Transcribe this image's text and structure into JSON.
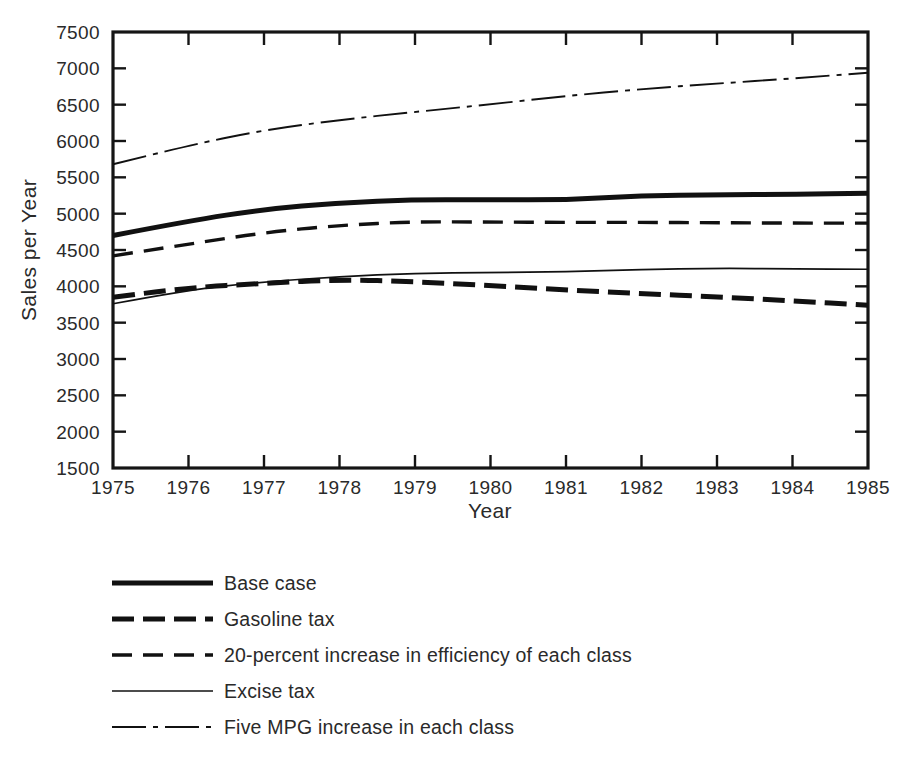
{
  "chart_data": {
    "type": "line",
    "title": "",
    "xlabel": "Year",
    "ylabel": "Sales per Year",
    "x": [
      1975,
      1976,
      1977,
      1978,
      1979,
      1980,
      1981,
      1982,
      1983,
      1984,
      1985
    ],
    "xtick_labels": [
      "1975",
      "1976",
      "1977",
      "1978",
      "1979",
      "1980",
      "1981",
      "1982",
      "1983",
      "1984",
      "1985"
    ],
    "xlim": [
      1975,
      1985
    ],
    "ylim": [
      1500,
      7500
    ],
    "ytick_labels": [
      "1500",
      "2000",
      "2500",
      "3000",
      "3500",
      "4000",
      "4500",
      "5000",
      "5500",
      "6000",
      "6500",
      "7000",
      "7500"
    ],
    "ytick_values": [
      1500,
      2000,
      2500,
      3000,
      3500,
      4000,
      4500,
      5000,
      5500,
      6000,
      6500,
      7000,
      7500
    ],
    "grid": false,
    "legend_position": "below-plot",
    "series": [
      {
        "name": "Base case",
        "style": "solid-thick",
        "values": [
          4700,
          4900,
          5060,
          5150,
          5195,
          5190,
          5190,
          5250,
          5260,
          5265,
          5280
        ]
      },
      {
        "name": "Gasoline tax",
        "style": "dashed-thick",
        "values": [
          3850,
          3985,
          4040,
          4095,
          4065,
          4010,
          3950,
          3900,
          3855,
          3800,
          3740
        ]
      },
      {
        "name": "20-percent increase in efficiency of each class",
        "style": "dashed-medium",
        "values": [
          4420,
          4580,
          4740,
          4840,
          4890,
          4885,
          4880,
          4880,
          4875,
          4870,
          4870
        ]
      },
      {
        "name": "Excise tax",
        "style": "solid-thin",
        "values": [
          3760,
          3955,
          4060,
          4135,
          4180,
          4190,
          4200,
          4230,
          4250,
          4240,
          4235
        ]
      },
      {
        "name": "Five MPG increase in each class",
        "style": "dash-dot-thin",
        "values": [
          5680,
          5940,
          6150,
          6290,
          6400,
          6505,
          6620,
          6715,
          6790,
          6860,
          6940
        ]
      }
    ]
  },
  "legend": {
    "items": [
      {
        "label": "Base case",
        "swatch": "solid-thick"
      },
      {
        "label": "Gasoline tax",
        "swatch": "dashed-thick"
      },
      {
        "label": "20-percent increase in efficiency of each class",
        "swatch": "dashed-medium"
      },
      {
        "label": "Excise tax",
        "swatch": "solid-thin"
      },
      {
        "label": "Five MPG increase in each class",
        "swatch": "dash-dot-thin"
      }
    ]
  },
  "colors": {
    "ink": "#111111",
    "background": "#ffffff"
  }
}
